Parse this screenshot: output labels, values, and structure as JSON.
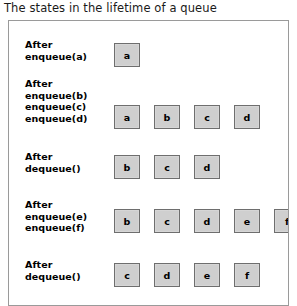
{
  "figure": {
    "caption": "The states in the lifetime of a queue",
    "box_fill_color": "#cfcfcf",
    "box_border_color": "#6e6e6e",
    "panel_border_color": "#9a9a9a",
    "background_color": "#ffffff",
    "text_color": "#000000"
  },
  "rows": [
    {
      "id": "after-enqueue-a",
      "label_lines": [
        "After",
        "enqueue(a)"
      ],
      "label_top": 18,
      "boxes_top": 22,
      "queue": [
        "a"
      ]
    },
    {
      "id": "after-enqueue-b-c-d",
      "label_lines": [
        "After",
        "enqueue(b)",
        "enqueue(c)",
        "enqueue(d)"
      ],
      "label_top": 57,
      "boxes_top": 84,
      "queue": [
        "a",
        "b",
        "c",
        "d"
      ]
    },
    {
      "id": "after-dequeue-1",
      "label_lines": [
        "After",
        "dequeue()"
      ],
      "label_top": 130,
      "boxes_top": 134,
      "queue": [
        "b",
        "c",
        "d"
      ]
    },
    {
      "id": "after-enqueue-e-f",
      "label_lines": [
        "After",
        "enqueue(e)",
        "enqueue(f)"
      ],
      "label_top": 178,
      "boxes_top": 188,
      "queue": [
        "b",
        "c",
        "d",
        "e",
        "f"
      ]
    },
    {
      "id": "after-dequeue-2",
      "label_lines": [
        "After",
        "dequeue()"
      ],
      "label_top": 238,
      "boxes_top": 242,
      "queue": [
        "c",
        "d",
        "e",
        "f"
      ]
    }
  ]
}
